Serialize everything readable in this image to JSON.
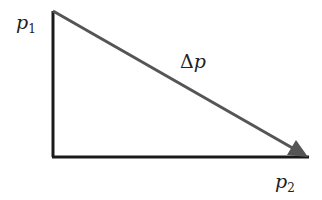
{
  "diagram": {
    "labels": {
      "p1": {
        "base": "p",
        "sub": "1"
      },
      "p2": {
        "base": "p",
        "sub": "2"
      },
      "delta": {
        "symbol": "Δ",
        "var": "p"
      }
    },
    "colors": {
      "legs": "#1a1a1a",
      "hypotenuse": "#555555",
      "text": "#222222"
    },
    "shape": "right-triangle-with-arrow",
    "arrow_direction": "from p1 to p2"
  }
}
